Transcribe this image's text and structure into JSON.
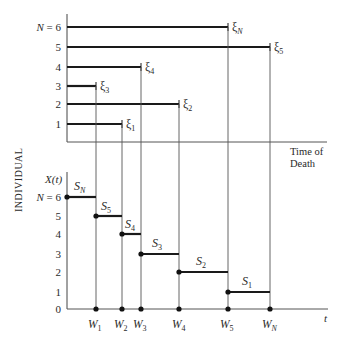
{
  "figure": {
    "y_axis_label": "INDIVIDUAL",
    "top_panel": {
      "x_axis_label_line1": "Time of",
      "x_axis_label_line2": "Death",
      "rows": [
        {
          "label": "N = 6",
          "end_label": "ξ",
          "end_sub": "N",
          "y": 27,
          "x_end": 228
        },
        {
          "label": "5",
          "end_label": "ξ",
          "end_sub": "5",
          "y": 47,
          "x_end": 270
        },
        {
          "label": "4",
          "end_label": "ξ",
          "end_sub": "4",
          "y": 67,
          "x_end": 141
        },
        {
          "label": "3",
          "end_label": "ξ",
          "end_sub": "3",
          "y": 86,
          "x_end": 96
        },
        {
          "label": "2",
          "end_label": "ξ",
          "end_sub": "2",
          "y": 104,
          "x_end": 179
        },
        {
          "label": "1",
          "end_label": "ξ",
          "end_sub": "1",
          "y": 124,
          "x_end": 122
        }
      ]
    },
    "bottom_panel": {
      "y_axis_title": "X(t)",
      "x_axis_label": "t",
      "levels": [
        {
          "label": "N = 6",
          "y": 197
        },
        {
          "label": "5",
          "y": 216
        },
        {
          "label": "4",
          "y": 234
        },
        {
          "label": "3",
          "y": 254
        },
        {
          "label": "2",
          "y": 272
        },
        {
          "label": "1",
          "y": 292
        },
        {
          "label": "0",
          "y": 309
        }
      ],
      "steps": [
        {
          "label": "S",
          "sub": "N",
          "level": 6,
          "x_start": 67,
          "x_end": 94
        },
        {
          "label": "S",
          "sub": "5",
          "level": 5,
          "x_start": 94,
          "x_end": 120
        },
        {
          "label": "S",
          "sub": "4",
          "level": 4,
          "x_start": 120,
          "x_end": 138
        },
        {
          "label": "S",
          "sub": "3",
          "level": 3,
          "x_start": 138,
          "x_end": 178
        },
        {
          "label": "S",
          "sub": "2",
          "level": 2,
          "x_start": 178,
          "x_end": 225
        },
        {
          "label": "S",
          "sub": "1",
          "level": 1,
          "x_start": 225,
          "x_end": 266
        }
      ],
      "waiting_times": [
        {
          "label": "W",
          "sub": "1",
          "x": 94
        },
        {
          "label": "W",
          "sub": "2",
          "x": 120
        },
        {
          "label": "W",
          "sub": "3",
          "x": 138
        },
        {
          "label": "W",
          "sub": "4",
          "x": 178
        },
        {
          "label": "W",
          "sub": "5",
          "x": 225
        },
        {
          "label": "W",
          "sub": "N",
          "x": 266
        }
      ]
    }
  }
}
